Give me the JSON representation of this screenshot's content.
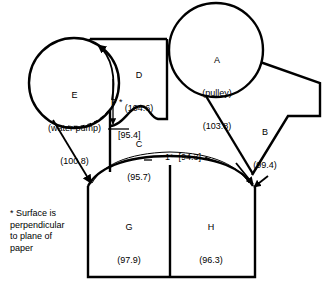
{
  "diagram": {
    "units_note": "values in parentheses are temperatures",
    "stroke_color": "#000000",
    "background_color": "#ffffff"
  },
  "callouts": [
    {
      "id": "A",
      "letter": "A",
      "name": "(pulley)",
      "value": "(103.8)",
      "shape": "circle"
    },
    {
      "id": "E",
      "letter": "E",
      "name": "(water pump)",
      "value": "(100.8)",
      "shape": "circle"
    },
    {
      "id": "B",
      "letter": "B",
      "name": "",
      "value": "(99.4)",
      "shape": "region"
    },
    {
      "id": "C",
      "letter": "C",
      "name": "",
      "value": "(95.7)",
      "shape": "region"
    },
    {
      "id": "D",
      "letter": "D",
      "name": "",
      "value": "(104.6)",
      "shape": "region"
    },
    {
      "id": "F",
      "letter": "F *",
      "name": "",
      "value": "[95.4]",
      "shape": "dimension"
    },
    {
      "id": "G",
      "letter": "G",
      "name": "",
      "value": "(97.9)",
      "shape": "region"
    },
    {
      "id": "H",
      "letter": "H",
      "name": "",
      "value": "(96.3)",
      "shape": "region"
    }
  ],
  "arch_label": "1*  [94.3]",
  "footnote": "* Surface is\nperpendicular\nto plane of\npaper",
  "labels": {
    "a_letter": "A",
    "a_name": "(pulley)",
    "a_value": "(103.8)",
    "e_letter": "E",
    "e_name": "(water pump)",
    "e_value": "(100.8)",
    "b_letter": "B",
    "b_value": "(99.4)",
    "c_letter": "C",
    "c_value": "(95.7)",
    "d_letter": "D",
    "d_value": "(104.6)",
    "f_letter": "F *",
    "f_value": "[95.4]",
    "g_letter": "G",
    "g_value": "(97.9)",
    "h_letter": "H",
    "h_value": "(96.3)"
  }
}
